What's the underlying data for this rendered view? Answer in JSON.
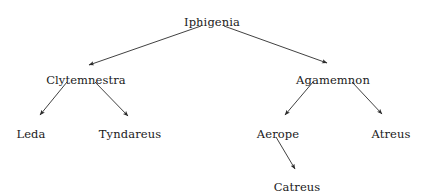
{
  "diagram": {
    "type": "directed-tree",
    "title_visible": false,
    "background_color": "#ffffff",
    "text_color": "#1a1a1a",
    "edge_color": "#2b2b2b",
    "nodes": [
      {
        "id": "iphigenia",
        "label": "Iphigenia",
        "x": 212,
        "y": 16
      },
      {
        "id": "clytemnestra",
        "label": "Clytemnestra",
        "x": 86,
        "y": 74
      },
      {
        "id": "agamemnon",
        "label": "Agamemnon",
        "x": 333,
        "y": 74
      },
      {
        "id": "leda",
        "label": "Leda",
        "x": 31,
        "y": 128
      },
      {
        "id": "tyndareus",
        "label": "Tyndareus",
        "x": 130,
        "y": 128
      },
      {
        "id": "aerope",
        "label": "Aerope",
        "x": 278,
        "y": 128
      },
      {
        "id": "atreus",
        "label": "Atreus",
        "x": 391,
        "y": 128
      },
      {
        "id": "catreus",
        "label": "Catreus",
        "x": 297,
        "y": 181
      }
    ],
    "edges": [
      {
        "id": "edge-iphigenia-clytemnestra",
        "from": "iphigenia",
        "to": "clytemnestra",
        "x1": 201,
        "y1": 26,
        "x2": 89,
        "y2": 65
      },
      {
        "id": "edge-iphigenia-agamemnon",
        "from": "iphigenia",
        "to": "agamemnon",
        "x1": 224,
        "y1": 26,
        "x2": 327,
        "y2": 63
      },
      {
        "id": "edge-clytemnestra-leda",
        "from": "clytemnestra",
        "to": "leda",
        "x1": 67,
        "y1": 82,
        "x2": 40,
        "y2": 115
      },
      {
        "id": "edge-clytemnestra-tyndareus",
        "from": "clytemnestra",
        "to": "tyndareus",
        "x1": 95,
        "y1": 82,
        "x2": 128,
        "y2": 116
      },
      {
        "id": "edge-agamemnon-aerope",
        "from": "agamemnon",
        "to": "aerope",
        "x1": 313,
        "y1": 82,
        "x2": 285,
        "y2": 115
      },
      {
        "id": "edge-agamemnon-atreus",
        "from": "agamemnon",
        "to": "atreus",
        "x1": 352,
        "y1": 82,
        "x2": 382,
        "y2": 114
      },
      {
        "id": "edge-aerope-catreus",
        "from": "aerope",
        "to": "catreus",
        "x1": 276,
        "y1": 137,
        "x2": 295,
        "y2": 169
      }
    ]
  }
}
